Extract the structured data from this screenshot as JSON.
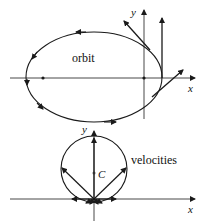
{
  "top_diagram": {
    "label": "orbit",
    "axis_x": "x",
    "axis_y": "y"
  },
  "bottom_diagram": {
    "label": "velocities",
    "center_label": "C",
    "axis_x": "x",
    "axis_y": "y"
  },
  "colors": {
    "stroke": "#1a1a1a",
    "axis": "#333333",
    "background": "#ffffff"
  }
}
